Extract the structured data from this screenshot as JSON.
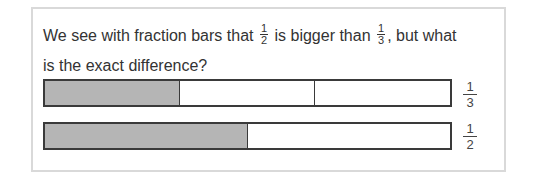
{
  "question": {
    "part1": "We see with fraction bars that",
    "frac1": {
      "num": "1",
      "den": "2"
    },
    "part2": "is bigger than",
    "frac2": {
      "num": "1",
      "den": "3"
    },
    "part3": ", but what is the exact difference?"
  },
  "colors": {
    "shaded": "#b5b5b5",
    "border": "#3a3a3a",
    "card_border": "#d9d9d9"
  },
  "bars": [
    {
      "label": {
        "num": "1",
        "den": "3"
      },
      "segments": 3,
      "shaded": 1
    },
    {
      "label": {
        "num": "1",
        "den": "2"
      },
      "segments": 2,
      "shaded": 1
    }
  ]
}
